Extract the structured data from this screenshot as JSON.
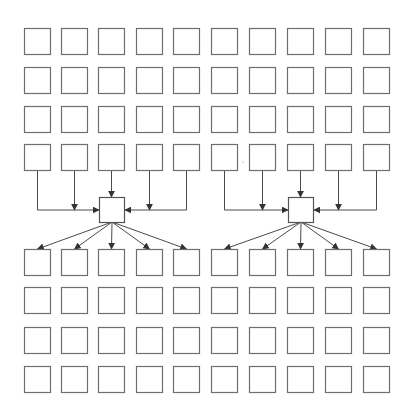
{
  "diagram": {
    "type": "grid-fan-in-fan-out",
    "canvas": {
      "width": 412,
      "height": 409,
      "background": "#ffffff"
    },
    "colors": {
      "box_stroke": "#6e6e6e",
      "hub_stroke": "#555555",
      "edge_stroke": "#4a4a4a"
    },
    "box_size": 26,
    "columns_x": [
      24,
      61,
      98,
      136,
      173,
      211,
      249,
      287,
      325,
      363
    ],
    "upper_rows_y": [
      28,
      67,
      106,
      144
    ],
    "lower_rows_y": [
      249,
      287,
      327,
      366
    ],
    "hubs": [
      {
        "id": "hub-left",
        "x": 99,
        "y": 197,
        "size": 25,
        "inputs_from_columns": [
          0,
          1,
          2,
          3,
          4
        ],
        "outputs_to_columns": [
          0,
          1,
          2,
          3,
          4
        ]
      },
      {
        "id": "hub-right",
        "x": 288,
        "y": 197,
        "size": 25,
        "inputs_from_columns": [
          5,
          6,
          7,
          8,
          9
        ],
        "outputs_to_columns": [
          5,
          6,
          7,
          8,
          9
        ]
      }
    ],
    "merge_line_y": 210,
    "labels": []
  }
}
